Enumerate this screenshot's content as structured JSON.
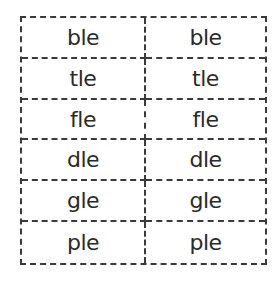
{
  "table": {
    "rows": [
      {
        "left": "ble",
        "right": "ble"
      },
      {
        "left": "tle",
        "right": "tle"
      },
      {
        "left": "fle",
        "right": "fle"
      },
      {
        "left": "dle",
        "right": "dle"
      },
      {
        "left": "gle",
        "right": "gle"
      },
      {
        "left": "ple",
        "right": "ple"
      }
    ]
  }
}
